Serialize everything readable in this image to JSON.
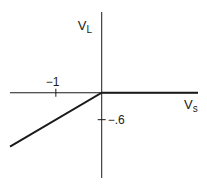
{
  "chart_data": {
    "type": "line",
    "title": "",
    "xlabel": "V",
    "xlabel_sub": "s",
    "ylabel": "V",
    "ylabel_sub": "L",
    "xlim": [
      -2.0,
      2.1
    ],
    "ylim": [
      -1.9,
      1.8
    ],
    "x_ticks": [
      {
        "value": -1,
        "label": "−1"
      }
    ],
    "y_ticks": [
      {
        "value": -0.6,
        "label": "−.6"
      }
    ],
    "grid": false,
    "legend": "none",
    "series": [
      {
        "name": "V_L vs V_s",
        "x": [
          -2.0,
          0,
          2.1
        ],
        "y": [
          -1.2,
          0,
          0
        ]
      }
    ],
    "colors": {
      "ink": "#1a1a1a",
      "background": "#ffffff"
    }
  }
}
